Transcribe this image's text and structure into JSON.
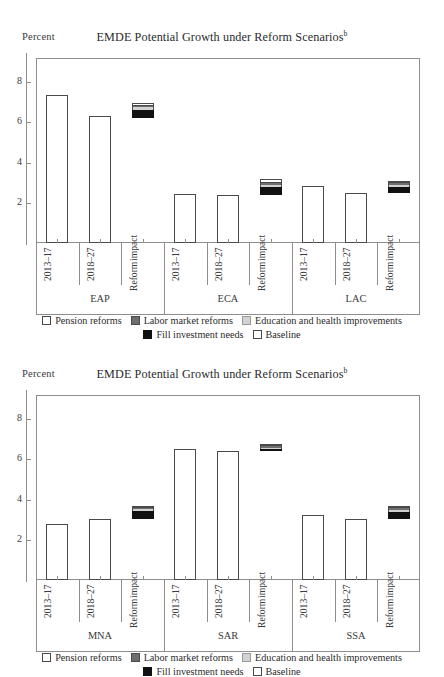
{
  "panels": [
    {
      "id": "panel-top",
      "ylabel": "Percent",
      "title": "EMDE Potential Growth under Reform Scenarios",
      "title_sup": "b"
    },
    {
      "id": "panel-bottom",
      "ylabel": "Percent",
      "title": "EMDE Potential Growth under Reform Scenarios",
      "title_sup": "b"
    }
  ],
  "legend": {
    "items": [
      {
        "label": "Pension reforms",
        "swatch": "white",
        "color": "#ffffff"
      },
      {
        "label": "Labor market reforms",
        "swatch": "dark",
        "color": "#6e6e6e"
      },
      {
        "label": "Education and health improvements",
        "swatch": "light",
        "color": "#d2d2d2"
      },
      {
        "label": "Fill investment needs",
        "swatch": "black",
        "color": "#111111"
      },
      {
        "label": "Baseline",
        "swatch": "white",
        "color": "#ffffff"
      }
    ]
  },
  "chart_data": [
    {
      "type": "bar",
      "title": "EMDE Potential Growth under Reform Scenarios",
      "subtitle": "b",
      "xlabel": "",
      "ylabel": "Percent",
      "ylim": [
        0,
        9.2
      ],
      "yticks": [
        2,
        4,
        6,
        8
      ],
      "grid": false,
      "legend_position": "bottom",
      "categories": [
        "2013–17",
        "2018–27",
        "Reform impact"
      ],
      "groups": [
        {
          "name": "EAP",
          "bars": [
            {
              "category": "2013–17",
              "type": "baseline",
              "value": 7.35
            },
            {
              "category": "2018–27",
              "type": "baseline",
              "value": 6.3
            },
            {
              "category": "Reform impact",
              "type": "stacked",
              "base": 6.2,
              "segments": [
                {
                  "name": "Fill investment needs",
                  "value": 0.42
                },
                {
                  "name": "Education and health improvements",
                  "value": 0.12
                },
                {
                  "name": "Labor market reforms",
                  "value": 0.08
                },
                {
                  "name": "Pension reforms",
                  "value": 0.12
                }
              ],
              "total": 6.94
            }
          ]
        },
        {
          "name": "ECA",
          "bars": [
            {
              "category": "2013–17",
              "type": "baseline",
              "value": 2.45
            },
            {
              "category": "2018–27",
              "type": "baseline",
              "value": 2.38
            },
            {
              "category": "Reform impact",
              "type": "stacked",
              "base": 2.38,
              "segments": [
                {
                  "name": "Fill investment needs",
                  "value": 0.4
                },
                {
                  "name": "Education and health improvements",
                  "value": 0.1
                },
                {
                  "name": "Labor market reforms",
                  "value": 0.1
                },
                {
                  "name": "Pension reforms",
                  "value": 0.22
                }
              ],
              "total": 3.2
            }
          ]
        },
        {
          "name": "LAC",
          "bars": [
            {
              "category": "2013–17",
              "type": "baseline",
              "value": 2.85
            },
            {
              "category": "2018–27",
              "type": "baseline",
              "value": 2.48
            },
            {
              "category": "Reform impact",
              "type": "stacked",
              "base": 2.48,
              "segments": [
                {
                  "name": "Fill investment needs",
                  "value": 0.3
                },
                {
                  "name": "Education and health improvements",
                  "value": 0.1
                },
                {
                  "name": "Labor market reforms",
                  "value": 0.08
                },
                {
                  "name": "Pension reforms",
                  "value": 0.1
                }
              ],
              "total": 3.06
            }
          ]
        }
      ]
    },
    {
      "type": "bar",
      "title": "EMDE Potential Growth under Reform Scenarios",
      "subtitle": "b",
      "xlabel": "",
      "ylabel": "Percent",
      "ylim": [
        0,
        9.2
      ],
      "yticks": [
        2,
        4,
        6,
        8
      ],
      "grid": false,
      "legend_position": "bottom",
      "categories": [
        "2013–17",
        "2018–27",
        "Reform impact"
      ],
      "groups": [
        {
          "name": "MNA",
          "bars": [
            {
              "category": "2013–17",
              "type": "baseline",
              "value": 2.78
            },
            {
              "category": "2018–27",
              "type": "baseline",
              "value": 3.05
            },
            {
              "category": "Reform impact",
              "type": "stacked",
              "base": 3.05,
              "segments": [
                {
                  "name": "Fill investment needs",
                  "value": 0.38
                },
                {
                  "name": "Education and health improvements",
                  "value": 0.08
                },
                {
                  "name": "Labor market reforms",
                  "value": 0.08
                },
                {
                  "name": "Pension reforms",
                  "value": 0.06
                }
              ],
              "total": 3.65
            }
          ]
        },
        {
          "name": "SAR",
          "bars": [
            {
              "category": "2013–17",
              "type": "baseline",
              "value": 6.5
            },
            {
              "category": "2018–27",
              "type": "baseline",
              "value": 6.4
            },
            {
              "category": "Reform impact",
              "type": "stacked",
              "base": 6.4,
              "segments": [
                {
                  "name": "Fill investment needs",
                  "value": 0.1
                },
                {
                  "name": "Education and health improvements",
                  "value": 0.08
                },
                {
                  "name": "Labor market reforms",
                  "value": 0.08
                },
                {
                  "name": "Pension reforms",
                  "value": 0.08
                }
              ],
              "total": 6.74
            }
          ]
        },
        {
          "name": "SSA",
          "bars": [
            {
              "category": "2013–17",
              "type": "baseline",
              "value": 3.25
            },
            {
              "category": "2018–27",
              "type": "baseline",
              "value": 3.05
            },
            {
              "category": "Reform impact",
              "type": "stacked",
              "base": 3.05,
              "segments": [
                {
                  "name": "Fill investment needs",
                  "value": 0.34
                },
                {
                  "name": "Education and health improvements",
                  "value": 0.1
                },
                {
                  "name": "Labor market reforms",
                  "value": 0.1
                },
                {
                  "name": "Pension reforms",
                  "value": 0.08
                }
              ],
              "total": 3.67
            }
          ]
        }
      ]
    }
  ]
}
